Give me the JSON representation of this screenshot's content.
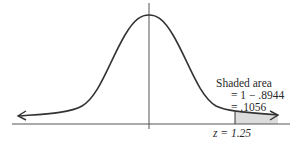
{
  "diagram": {
    "type": "normal-distribution-curve",
    "shaded_region": "right tail beyond z",
    "annotation": {
      "line1": "Shaded area",
      "line2": "= 1 − .8944",
      "line3": "= .1056"
    },
    "z_label": "z = 1.25",
    "colors": {
      "curve": "#333333",
      "axis": "#555555",
      "shade": "#dcdcdc"
    }
  }
}
